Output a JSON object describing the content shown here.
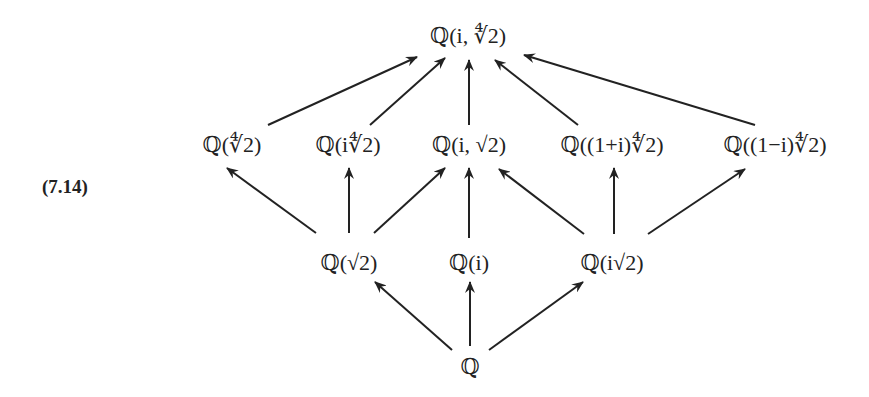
{
  "equation_label": "(7.14)",
  "nodes": {
    "top": "ℚ(i, ∜2)",
    "m1": "ℚ(∜2)",
    "m2": "ℚ(i∜2)",
    "m3": "ℚ(i, √2)",
    "m4": "ℚ((1+i)∜2)",
    "m5": "ℚ((1−i)∜2)",
    "b1": "ℚ(√2)",
    "b2": "ℚ(i)",
    "b3": "ℚ(i√2)",
    "base": "ℚ"
  },
  "edges": [
    [
      "m1",
      "top"
    ],
    [
      "m2",
      "top"
    ],
    [
      "m3",
      "top"
    ],
    [
      "m4",
      "top"
    ],
    [
      "m5",
      "top"
    ],
    [
      "b1",
      "m1"
    ],
    [
      "b1",
      "m2"
    ],
    [
      "b1",
      "m3"
    ],
    [
      "b2",
      "m3"
    ],
    [
      "b3",
      "m3"
    ],
    [
      "b3",
      "m4"
    ],
    [
      "b3",
      "m5"
    ],
    [
      "base",
      "b1"
    ],
    [
      "base",
      "b2"
    ],
    [
      "base",
      "b3"
    ]
  ]
}
